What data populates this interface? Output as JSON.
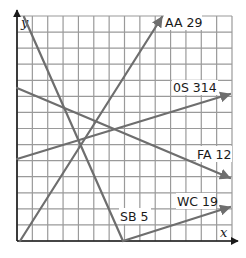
{
  "chart_data": {
    "type": "line",
    "title": "",
    "xlabel": "x",
    "ylabel": "y",
    "grid": true,
    "grid_cells": {
      "columns": 14,
      "rows": 14
    },
    "xlim": [
      0,
      14
    ],
    "ylim": [
      0,
      14
    ],
    "series": [
      {
        "name": "AA 29",
        "x": [
          0.2,
          9.4
        ],
        "y": [
          0,
          14
        ],
        "arrow": "end"
      },
      {
        "name": "0S 314",
        "x": [
          0,
          13.8
        ],
        "y": [
          5.3,
          9.6
        ],
        "arrow": "end"
      },
      {
        "name": "FA 12",
        "x": [
          0,
          13.8
        ],
        "y": [
          9.9,
          4.1
        ],
        "arrow": "end"
      },
      {
        "name": "WC 19",
        "x": [
          6.9,
          13.8
        ],
        "y": [
          0,
          2.2
        ],
        "arrow": "end"
      },
      {
        "name": "SB 5",
        "x": [
          0.4,
          6.9
        ],
        "y": [
          14,
          0
        ],
        "arrow": "none"
      }
    ]
  },
  "axes": {
    "x_label": "x",
    "y_label": "y"
  },
  "labels": {
    "aa": "AA 29",
    "os": "0S 314",
    "fa": "FA 12",
    "wc": "WC 19",
    "sb": "SB 5"
  },
  "colors": {
    "grid": "#9a9a9a",
    "axis": "#1a1a1a",
    "line": "#6e6e6e",
    "text": "#1a1a1a"
  }
}
